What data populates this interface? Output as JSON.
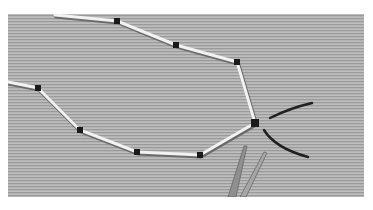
{
  "image": {
    "description": "Grayscale photo of white straws joined by dark connectors forming a branching chain on a striped gray surface, with two dark curved wire pieces and an open pair of scissors at the bottom right",
    "colors": {
      "background": "#ffffff",
      "surface": "#a9a9a9",
      "straw": "#f2f2f2",
      "joint": "#1a1a1a",
      "wire": "#202020",
      "scissors": "#8a8a8a"
    }
  }
}
